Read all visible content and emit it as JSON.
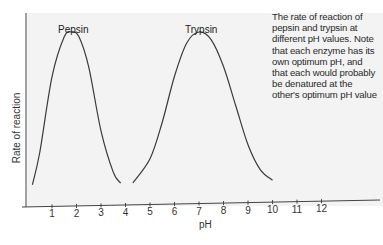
{
  "chart_data": {
    "type": "line",
    "title": "",
    "caption": "The rate of reaction of pepsin and trypsin at different pH values. Note that each enzyme has its own optimum pH, and that each would probably be denatured at the other's optimum pH value",
    "xlabel": "pH",
    "ylabel": "Rate of reaction",
    "xlim": [
      0,
      14
    ],
    "x_ticks": [
      1,
      2,
      3,
      4,
      5,
      6,
      7,
      8,
      9,
      10,
      11,
      12
    ],
    "y_ticks": [],
    "grid": false,
    "legend": "none (series labeled directly above peaks)",
    "series": [
      {
        "name": "Pepsin",
        "optimum_pH": 1.8,
        "x": [
          0.2,
          0.5,
          1.0,
          1.5,
          1.8,
          2.1,
          2.5,
          3.0,
          3.5,
          3.8
        ],
        "values": [
          0.05,
          0.25,
          0.72,
          0.97,
          1.0,
          0.97,
          0.78,
          0.38,
          0.12,
          0.05
        ]
      },
      {
        "name": "Trypsin",
        "optimum_pH": 7.0,
        "x": [
          4.3,
          5.0,
          5.5,
          6.0,
          6.5,
          7.0,
          7.5,
          8.0,
          8.5,
          9.0,
          9.5,
          10.0
        ],
        "values": [
          0.05,
          0.2,
          0.43,
          0.72,
          0.93,
          1.0,
          0.95,
          0.78,
          0.53,
          0.28,
          0.12,
          0.05
        ]
      }
    ]
  },
  "labels": {
    "pepsin": "Pepsin",
    "trypsin": "Trypsin",
    "xlabel": "pH",
    "ylabel": "Rate of reaction",
    "caption": "The rate of reaction of pepsin and trypsin at different pH values. Note that each enzyme has its own optimum pH, and that each would probably be denatured at the other's optimum pH value",
    "ticks": [
      "1",
      "2",
      "3",
      "4",
      "5",
      "6",
      "7",
      "8",
      "9",
      "10",
      "11",
      "12"
    ]
  },
  "colors": {
    "plot_background": "#f3f3f3",
    "curve": "#3a3a3a",
    "axis": "#444444",
    "text": "#2a2a2a"
  }
}
